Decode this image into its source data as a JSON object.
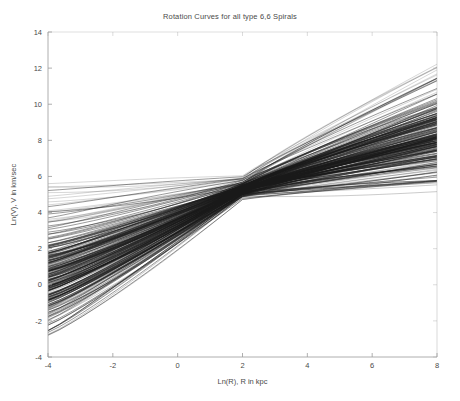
{
  "figure": {
    "title": "Rotation Curves for all type 6,6 Spirals",
    "background_color": "#ffffff",
    "axis_color": "#9a9a9a",
    "line_color": "#1a1a1a",
    "text_color": "#4a4a4a"
  },
  "chart_data": {
    "type": "line",
    "title": "Rotation Curves for all type 6,6 Spirals",
    "xlabel": "Ln(R), R in kpc",
    "ylabel": "Ln(V), V in km/sec",
    "xlim": [
      -4,
      8
    ],
    "ylim": [
      -4,
      14
    ],
    "xticks": [
      -4,
      -2,
      0,
      2,
      4,
      6,
      8
    ],
    "yticks": [
      -4,
      -2,
      0,
      2,
      4,
      6,
      8,
      10,
      12,
      14
    ],
    "xtick_labels": [
      "-4",
      "-2",
      "0",
      "2",
      "4",
      "6",
      "8"
    ],
    "ytick_labels": [
      "-4",
      "-2",
      "0",
      "2",
      "4",
      "6",
      "8",
      "10",
      "12",
      "14"
    ],
    "grid": false,
    "legend": null,
    "legend_position": "none",
    "series_count": 230,
    "pinch_point": [
      2.0,
      5.3
    ],
    "pinch_spread": 0.55,
    "left_edge_value_range": [
      -2.9,
      5.6
    ],
    "left_edge_dense_range": [
      0.2,
      5.5
    ],
    "right_edge_value_range": [
      4.6,
      12.4
    ],
    "right_edge_dense_range": [
      5.6,
      9.6
    ],
    "annotations": []
  },
  "axes": {
    "x_title": "Ln(R), R in kpc",
    "y_title": "Ln(V), V in km/sec"
  }
}
